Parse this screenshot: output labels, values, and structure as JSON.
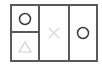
{
  "board": {
    "cells": [
      {
        "id": "top-left",
        "symbol": "circle",
        "color": "#3a3a3a"
      },
      {
        "id": "bottom-left",
        "symbol": "triangle",
        "color": "#cfcfcf"
      },
      {
        "id": "middle",
        "symbol": "cross",
        "color": "#d6d6d6"
      },
      {
        "id": "right",
        "symbol": "circle",
        "color": "#3a3a3a"
      }
    ],
    "border_color": "#5a5a5a"
  }
}
